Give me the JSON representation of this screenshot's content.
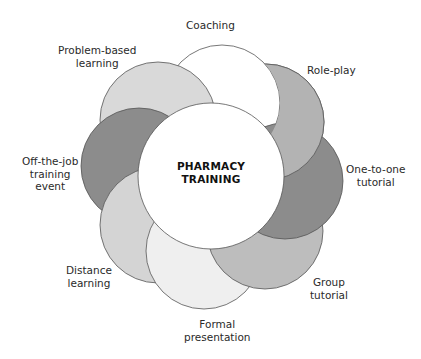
{
  "diagram": {
    "center": {
      "line1": "PHARMACY",
      "line2": "TRAINING",
      "fill": "#ffffff"
    },
    "petals": [
      {
        "id": "coaching",
        "lines": [
          "Coaching"
        ],
        "fill": "#ffffff"
      },
      {
        "id": "role-play",
        "lines": [
          "Role-play"
        ],
        "fill": "#b3b3b3"
      },
      {
        "id": "one-to-one-tutorial",
        "lines": [
          "One-to-one",
          "tutorial"
        ],
        "fill": "#8c8c8c"
      },
      {
        "id": "group-tutorial",
        "lines": [
          "Group",
          "tutorial"
        ],
        "fill": "#bdbdbd"
      },
      {
        "id": "formal-presentation",
        "lines": [
          "Formal",
          "presentation"
        ],
        "fill": "#efefef"
      },
      {
        "id": "distance-learning",
        "lines": [
          "Distance",
          "learning"
        ],
        "fill": "#d4d4d4"
      },
      {
        "id": "off-the-job-training-event",
        "lines": [
          "Off-the-job",
          "training",
          "event"
        ],
        "fill": "#8c8c8c"
      },
      {
        "id": "problem-based-learning",
        "lines": [
          "Problem-based",
          "learning"
        ],
        "fill": "#d9d9d9"
      }
    ],
    "stroke": "#555555"
  }
}
